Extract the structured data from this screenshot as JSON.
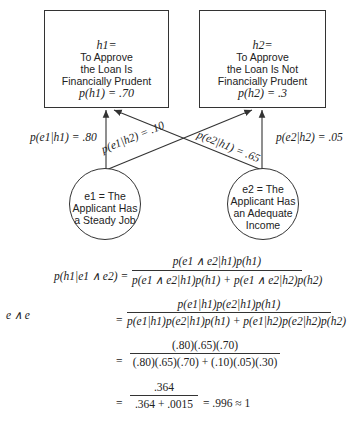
{
  "hypotheses": [
    {
      "var": "h1=",
      "lines": [
        "To Approve",
        "the Loan Is",
        "Financially Prudent"
      ],
      "prior": "p(h1) = .70"
    },
    {
      "var": "h2=",
      "lines": [
        "To Approve",
        "the Loan Is Not",
        "Financially Prudent"
      ],
      "prior": "p(h2) = .3"
    }
  ],
  "evidence": [
    {
      "var": "e1 = The",
      "lines": [
        "Applicant Has",
        "a Steady Job"
      ]
    },
    {
      "var": "e2 = The",
      "lines": [
        "Applicant Has",
        "an Adequate",
        "Income"
      ]
    }
  ],
  "edges": {
    "e1h1": "p(e1|h1) = .80",
    "e1h2": "p(e1|h2) = .10",
    "e2h1": "p(e2|h1) = .65",
    "e2h2": "p(e2|h2) = .05"
  },
  "equations": {
    "lhs": "p(h1|e1 ∧ e2) =",
    "side_label": "e ∧ e",
    "eq": "=",
    "f1_num": "p(e1 ∧ e2|h1)p(h1)",
    "f1_den": "p(e1 ∧ e2|h1)p(h1) + p(e1 ∧ e2|h2)p(h2)",
    "f2_num": "p(e1|h1)p(e2|h1)p(h1)",
    "f2_den": "p(e1|h1)p(e2|h1)p(h1) + p(e1|h2)p(e2|h2)p(h2)",
    "f3_num": "(.80)(.65)(.70)",
    "f3_den": "(.80)(.65)(.70) + (.10)(.05)(.30)",
    "f4_num": ".364",
    "f4_den": ".364 + .0015",
    "result": "= .996 ≈ 1"
  }
}
